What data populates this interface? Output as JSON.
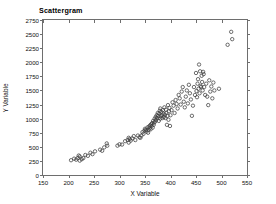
{
  "chart": {
    "title": "Scattergram",
    "frame_color": "#6e6e6e",
    "marker_color": "#3d3d3d"
  },
  "chart_data": {
    "type": "scatter",
    "title": "Scattergram",
    "xlabel": "X Variable",
    "ylabel": "Y Variable",
    "xlim": [
      150,
      550
    ],
    "ylim": [
      0,
      2750
    ],
    "xticks": [
      150,
      200,
      250,
      300,
      350,
      400,
      450,
      500,
      550
    ],
    "yticks": [
      0,
      250,
      500,
      750,
      1000,
      1250,
      1500,
      1750,
      2000,
      2250,
      2500,
      2750
    ],
    "grid": false,
    "legend": null,
    "marker": "open-circle",
    "x": [
      205,
      211,
      215,
      218,
      220,
      222,
      222,
      226,
      229,
      233,
      238,
      243,
      247,
      252,
      262,
      266,
      270,
      275,
      276,
      296,
      300,
      305,
      311,
      316,
      318,
      318,
      320,
      322,
      325,
      328,
      331,
      336,
      339,
      341,
      343,
      345,
      347,
      349,
      350,
      352,
      353,
      355,
      356,
      357,
      358,
      359,
      360,
      361,
      362,
      363,
      364,
      365,
      366,
      367,
      368,
      369,
      370,
      371,
      372,
      373,
      374,
      375,
      376,
      377,
      378,
      379,
      380,
      380,
      381,
      382,
      383,
      384,
      385,
      386,
      387,
      388,
      389,
      390,
      391,
      392,
      393,
      394,
      395,
      396,
      397,
      398,
      399,
      400,
      402,
      404,
      406,
      408,
      410,
      412,
      414,
      416,
      418,
      420,
      422,
      424,
      426,
      428,
      430,
      432,
      434,
      436,
      438,
      440,
      442,
      444,
      446,
      448,
      450,
      451,
      452,
      453,
      454,
      455,
      456,
      457,
      458,
      459,
      460,
      461,
      462,
      463,
      464,
      465,
      466,
      468,
      470,
      472,
      474,
      476,
      478,
      480,
      482,
      484,
      486,
      495,
      512,
      519,
      521
    ],
    "y": [
      262,
      290,
      272,
      300,
      345,
      255,
      330,
      280,
      300,
      355,
      340,
      395,
      370,
      420,
      450,
      430,
      490,
      560,
      520,
      520,
      545,
      540,
      600,
      620,
      575,
      660,
      640,
      610,
      650,
      690,
      620,
      700,
      670,
      660,
      700,
      760,
      730,
      790,
      820,
      800,
      770,
      845,
      750,
      800,
      860,
      830,
      880,
      810,
      900,
      870,
      920,
      840,
      960,
      890,
      930,
      1000,
      950,
      1030,
      980,
      1060,
      1010,
      1100,
      1050,
      960,
      1090,
      1140,
      1000,
      1180,
      1040,
      1120,
      1060,
      1010,
      1150,
      1090,
      1030,
      1200,
      1070,
      1010,
      1160,
      1100,
      890,
      1050,
      1240,
      980,
      1130,
      1190,
      870,
      1060,
      1150,
      1290,
      1230,
      1100,
      1330,
      1260,
      1180,
      1420,
      1360,
      1250,
      1480,
      1560,
      1300,
      1200,
      1390,
      1500,
      1270,
      1600,
      1450,
      1340,
      1050,
      1230,
      1560,
      1420,
      1810,
      1490,
      1380,
      1620,
      1700,
      1530,
      1960,
      1450,
      1840,
      1580,
      1560,
      1760,
      1650,
      1500,
      1830,
      1790,
      1560,
      1420,
      1620,
      1390,
      1240,
      1680,
      1480,
      1570,
      1360,
      1640,
      1500,
      1530,
      2310,
      2540,
      2410
    ]
  }
}
